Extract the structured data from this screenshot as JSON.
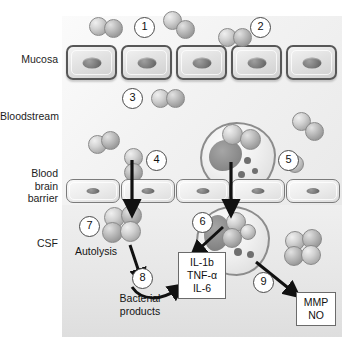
{
  "diagram": {
    "type": "biological-process-diagram",
    "compartments": [
      {
        "id": "mucosa",
        "label": "Mucosa"
      },
      {
        "id": "bloodstream",
        "label": "Bloodstream"
      },
      {
        "id": "bbb",
        "label": "Blood\nbrain\nbarrier"
      },
      {
        "id": "csf",
        "label": "CSF"
      }
    ],
    "steps": [
      {
        "n": "1",
        "meaning": "colonization of mucosal surface"
      },
      {
        "n": "2",
        "meaning": "adherence to epithelium"
      },
      {
        "n": "3",
        "meaning": "invasion of bloodstream"
      },
      {
        "n": "4",
        "meaning": "free bacteria cross blood brain barrier"
      },
      {
        "n": "5",
        "meaning": "bacteria inside leukocyte in bloodstream"
      },
      {
        "n": "6",
        "meaning": "leukocyte in CSF releases cytokines"
      },
      {
        "n": "7",
        "meaning": "bacterial multiplication and autolysis in CSF"
      },
      {
        "n": "8",
        "meaning": "bacterial products stimulate cytokine release"
      },
      {
        "n": "9",
        "meaning": "release of MMP and NO"
      }
    ],
    "annotations": [
      {
        "id": "autolysis",
        "text": "Autolysis"
      },
      {
        "id": "bacterial-products",
        "text": "Bacterial\nproducts"
      }
    ],
    "boxes": [
      {
        "id": "cytokines",
        "lines": [
          "IL-1b",
          "TNF-α",
          "IL-6"
        ]
      },
      {
        "id": "mediators",
        "lines": [
          "MMP",
          "NO"
        ]
      }
    ],
    "colors": {
      "cell_border": "#575757",
      "bacteria": "#c9c9c9",
      "leukocyte_nucleus": "#8c8c8c",
      "arrow": "#111111",
      "background": "#eeeeee"
    }
  }
}
